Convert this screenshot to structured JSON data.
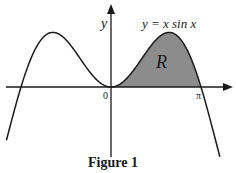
{
  "chart_data": {
    "type": "line",
    "title": "",
    "caption": "Figure 1",
    "function": "y = x sin x",
    "xlabel": "",
    "ylabel": "y",
    "x_ticks": [
      {
        "value": 0,
        "label": "0"
      },
      {
        "value": 3.14159,
        "label": "π"
      }
    ],
    "xlim": [
      -3.65,
      3.85
    ],
    "ylim": [
      -2.4,
      2.7
    ],
    "grid": false,
    "legend": null,
    "series": [
      {
        "name": "y = x sin x",
        "x": [
          -3.6,
          -3.14159,
          -2.5,
          -2.03,
          -1.5,
          -1.0,
          -0.5,
          0,
          0.5,
          1.0,
          1.5,
          2.03,
          2.5,
          3.14159,
          3.5,
          3.8
        ],
        "y": [
          -1.59,
          0,
          1.5,
          1.82,
          1.5,
          0.84,
          0.24,
          0,
          0.24,
          0.84,
          1.5,
          1.82,
          1.5,
          0,
          -1.23,
          -2.32
        ]
      }
    ],
    "shaded_region": {
      "label": "R",
      "from_x": 0,
      "to_x": 3.14159,
      "description": "Region between curve y = x sin x and the x-axis for 0 ≤ x ≤ π"
    },
    "annotations": [
      {
        "text": "y = x sin x",
        "near": "right peak"
      },
      {
        "text": "R",
        "near": "inside shaded region"
      }
    ]
  },
  "labels": {
    "y_axis": "y",
    "equation": "y = x sin x",
    "region": "R",
    "origin": "0",
    "pi": "π",
    "caption": "Figure 1"
  },
  "colors": {
    "curve": "#1a1a1a",
    "axes": "#1a1a1a",
    "shade": "#8c8c8c",
    "background": "#ffffff"
  }
}
